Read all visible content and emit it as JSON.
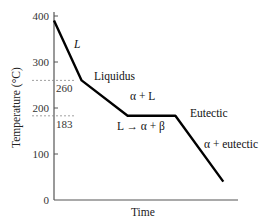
{
  "chart_data": {
    "type": "line",
    "title": "",
    "xlabel": "Time",
    "ylabel": "Temperature (°C)",
    "ylim": [
      0,
      400
    ],
    "xlim": [
      0,
      10
    ],
    "yticks": [
      0,
      100,
      200,
      300,
      400
    ],
    "ytick_labels": [
      "0",
      "100",
      "200",
      "300",
      "400"
    ],
    "grid": false,
    "series": [
      {
        "name": "cooling curve",
        "color": "#000000",
        "points": [
          {
            "t": 0.0,
            "T": 390
          },
          {
            "t": 1.5,
            "T": 260
          },
          {
            "t": 4.0,
            "T": 183
          },
          {
            "t": 6.6,
            "T": 183
          },
          {
            "t": 9.2,
            "T": 40
          }
        ]
      }
    ],
    "reference_lines": [
      {
        "value": 260,
        "label": "260"
      },
      {
        "value": 183,
        "label": "183"
      }
    ],
    "annotations": [
      {
        "id": "liquid",
        "text": "L",
        "italic": true
      },
      {
        "id": "liquidus",
        "text": "Liquidus",
        "italic": false
      },
      {
        "id": "alpha-l",
        "text": "α + L",
        "italic": false
      },
      {
        "id": "eutectic",
        "text": "Eutectic",
        "italic": false
      },
      {
        "id": "reaction",
        "text": "L → α + β",
        "italic": false
      },
      {
        "id": "alpha-eutectic",
        "text": "α + eutectic",
        "italic": false
      }
    ]
  }
}
